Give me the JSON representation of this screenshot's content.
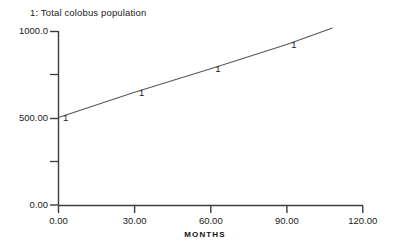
{
  "chart_data": {
    "type": "line",
    "title": "1: Total colobus population",
    "xlabel": "MONTHS",
    "ylabel": "",
    "xlim": [
      0,
      120
    ],
    "ylim": [
      0,
      1000
    ],
    "grid": false,
    "legend_position": "top-left",
    "series": [
      {
        "name": "1: Total colobus population",
        "marker_label": "1",
        "x": [
          0,
          30,
          60,
          90,
          108
        ],
        "values": [
          505,
          650,
          785,
          925,
          1020
        ],
        "marker_x": [
          0,
          30,
          60,
          90
        ],
        "marker_values": [
          505,
          650,
          785,
          925
        ]
      }
    ],
    "x_ticks": [
      0,
      30,
      60,
      90,
      120
    ],
    "x_tick_labels": [
      "0.00",
      "30.00",
      "60.00",
      "90.00",
      "120.00"
    ],
    "y_ticks": [
      0,
      500,
      1000
    ],
    "y_tick_labels": [
      "0.00",
      "500.00",
      "1000.0"
    ],
    "y_minor_ticks": [
      250,
      750
    ],
    "colors": {
      "background": "#ffffff",
      "axis": "#3c3c3c",
      "line": "#55555f",
      "text": "#1a1a1a"
    }
  },
  "legend": {
    "entry_1": "1: Total colobus population"
  },
  "axes": {
    "x_title": "MONTHS",
    "y_tick_0": "0.00",
    "y_tick_1": "500.00",
    "y_tick_2": "1000.0",
    "x_tick_0": "0.00",
    "x_tick_1": "30.00",
    "x_tick_2": "60.00",
    "x_tick_3": "90.00",
    "x_tick_4": "120.00"
  },
  "markers": {
    "m0": "1",
    "m1": "1",
    "m2": "1",
    "m3": "1"
  }
}
